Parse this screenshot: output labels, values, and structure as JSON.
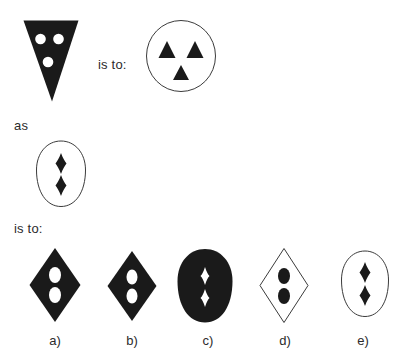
{
  "page": {
    "kind": "visual-analogy-puzzle",
    "background_color": "#ffffff",
    "ink_color": "#1a1a1a",
    "outline_color": "#3b3b3b",
    "text_color": "#2b2b2b",
    "width": 408,
    "height": 361
  },
  "prompt": {
    "is_to_1": "is to:",
    "as": "as",
    "is_to_2": "is to:"
  },
  "figures": {
    "stimulus_a": {
      "name": "inverted-triangle-with-white-circles",
      "outer_shape": "inverted-triangle",
      "fill": "black",
      "inner_shape": "circle",
      "inner_fill": "white",
      "inner_count": 3
    },
    "stimulus_b": {
      "name": "circle-with-black-triangles",
      "outer_shape": "circle",
      "fill": "white",
      "inner_shape": "triangle",
      "inner_fill": "black",
      "inner_count": 3
    },
    "stimulus_c": {
      "name": "egg-with-black-diamonds",
      "outer_shape": "egg",
      "fill": "white",
      "inner_shape": "diamond",
      "inner_fill": "black",
      "inner_count": 2
    }
  },
  "options": [
    {
      "id": "a",
      "label": "a)",
      "outer_shape": "diamond",
      "fill": "black",
      "inner_shape": "ellipse",
      "inner_fill": "white",
      "inner_count": 2
    },
    {
      "id": "b",
      "label": "b)",
      "outer_shape": "diamond",
      "fill": "black",
      "inner_shape": "ellipse",
      "inner_fill": "white",
      "inner_count": 2
    },
    {
      "id": "c",
      "label": "c)",
      "outer_shape": "egg",
      "fill": "black",
      "inner_shape": "diamond",
      "inner_fill": "white",
      "inner_count": 2
    },
    {
      "id": "d",
      "label": "d)",
      "outer_shape": "diamond",
      "fill": "white",
      "inner_shape": "ellipse",
      "inner_fill": "black",
      "inner_count": 2
    },
    {
      "id": "e",
      "label": "e)",
      "outer_shape": "egg",
      "fill": "white",
      "inner_shape": "diamond",
      "inner_fill": "black",
      "inner_count": 2
    }
  ]
}
